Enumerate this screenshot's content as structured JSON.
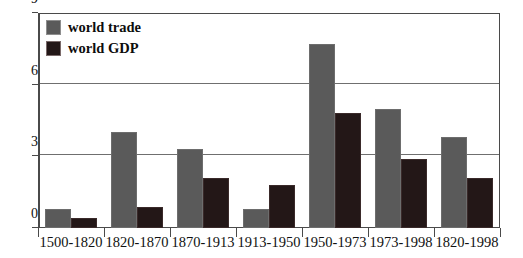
{
  "chart_data": {
    "type": "bar",
    "title": "",
    "xlabel": "",
    "ylabel": "",
    "ylim": [
      0,
      9
    ],
    "yticks": [
      "0",
      "3",
      "6",
      "9"
    ],
    "grid": true,
    "legend_position": "top-left",
    "categories": [
      "1500-1820",
      "1820-1870",
      "1870-1913",
      "1913-1950",
      "1950-1973",
      "1973-1998",
      "1820-1998"
    ],
    "series": [
      {
        "name": "world trade",
        "color": "#5a5a5a",
        "values": [
          0.8,
          4.0,
          3.3,
          0.8,
          7.7,
          5.0,
          3.8
        ]
      },
      {
        "name": "world GDP",
        "color": "#231717",
        "values": [
          0.4,
          0.9,
          2.1,
          1.8,
          4.8,
          2.9,
          2.1
        ]
      }
    ]
  },
  "legend": {
    "items": [
      {
        "label": "world trade",
        "swatch": "gray-swatch-icon"
      },
      {
        "label": "world GDP",
        "swatch": "black-swatch-icon"
      }
    ]
  },
  "colors": {
    "world_trade": "#5a5a5a",
    "world_gdp": "#231717",
    "axis": "#4a4a4a",
    "gridline": "#6f6f6f",
    "background": "#ffffff"
  }
}
